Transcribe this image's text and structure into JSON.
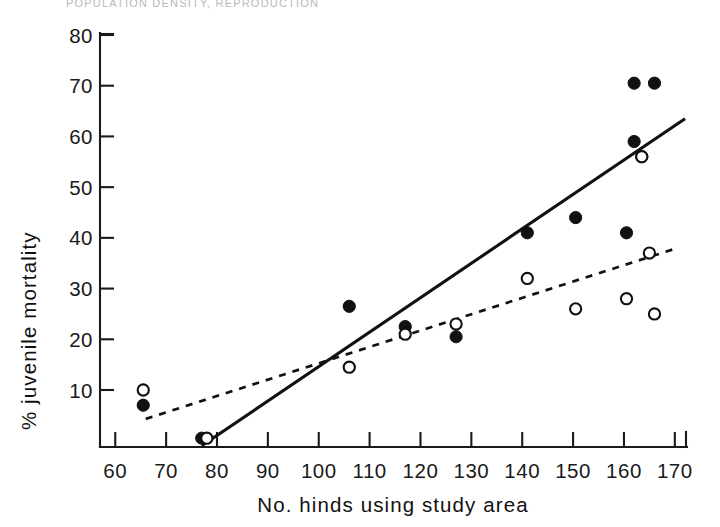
{
  "header": {
    "running_title": "POPULATION DENSITY, REPRODUCTION"
  },
  "chart_data": {
    "type": "scatter",
    "title": "",
    "xlabel": "No. hinds using study area",
    "ylabel": "% juvenile mortality",
    "xlim": [
      57,
      172
    ],
    "ylim": [
      -1.3,
      80
    ],
    "grid": false,
    "legend": "none",
    "xticks": [
      60,
      70,
      80,
      90,
      100,
      110,
      120,
      130,
      140,
      150,
      160,
      170
    ],
    "xticklabels": [
      "60",
      "70",
      "80",
      "90",
      "100",
      "110",
      "120",
      "130",
      "140",
      "150",
      "160",
      "170"
    ],
    "yticks": [
      10,
      20,
      30,
      40,
      50,
      60,
      70,
      80
    ],
    "yticklabels": [
      "10",
      "20",
      "30",
      "40",
      "50",
      "60",
      "70",
      "80"
    ],
    "series": [
      {
        "name": "filled-circles",
        "marker": "filled circle",
        "color": "#111111",
        "points": [
          {
            "x": 65.5,
            "y": 7
          },
          {
            "x": 77,
            "y": 0.5
          },
          {
            "x": 106,
            "y": 26.5
          },
          {
            "x": 117,
            "y": 22.5
          },
          {
            "x": 127,
            "y": 20.5
          },
          {
            "x": 141,
            "y": 41
          },
          {
            "x": 150.5,
            "y": 44
          },
          {
            "x": 160.5,
            "y": 41
          },
          {
            "x": 162,
            "y": 59
          },
          {
            "x": 163.5,
            "y": 56
          },
          {
            "x": 162,
            "y": 70.5
          },
          {
            "x": 166,
            "y": 70.5
          }
        ]
      },
      {
        "name": "open-circles",
        "marker": "open circle",
        "color": "#111111",
        "points": [
          {
            "x": 65.5,
            "y": 10
          },
          {
            "x": 78,
            "y": 0.5
          },
          {
            "x": 106,
            "y": 14.5
          },
          {
            "x": 117,
            "y": 21
          },
          {
            "x": 127,
            "y": 23
          },
          {
            "x": 141,
            "y": 32
          },
          {
            "x": 150.5,
            "y": 26
          },
          {
            "x": 160.5,
            "y": 28
          },
          {
            "x": 163.5,
            "y": 56
          },
          {
            "x": 165,
            "y": 37
          },
          {
            "x": 166,
            "y": 25
          }
        ]
      }
    ],
    "fit_lines": [
      {
        "name": "solid-regression-line",
        "style": "solid",
        "x0": 77,
        "y0": -1.0,
        "x1": 172,
        "y1": 63.5
      },
      {
        "name": "dashed-regression-line",
        "style": "dashed",
        "x0": 66,
        "y0": 4.3,
        "x1": 170.5,
        "y1": 38.0
      }
    ]
  }
}
